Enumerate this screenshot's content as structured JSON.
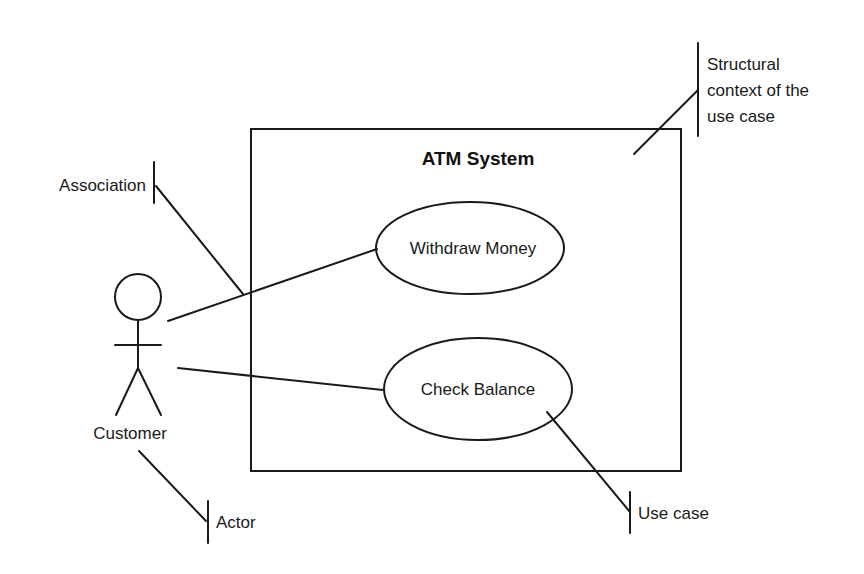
{
  "diagram": {
    "type": "UML use case diagram",
    "system": {
      "title": "ATM System"
    },
    "actor": {
      "label": "Customer"
    },
    "use_cases": [
      {
        "label": "Withdraw Money"
      },
      {
        "label": "Check Balance"
      }
    ],
    "callouts": {
      "association": "Association",
      "structural_context": [
        "Structural",
        "context of the",
        "use case"
      ],
      "use_case": "Use case",
      "actor": "Actor"
    },
    "colors": {
      "stroke": "#1a1a1a",
      "background": "#ffffff"
    }
  }
}
